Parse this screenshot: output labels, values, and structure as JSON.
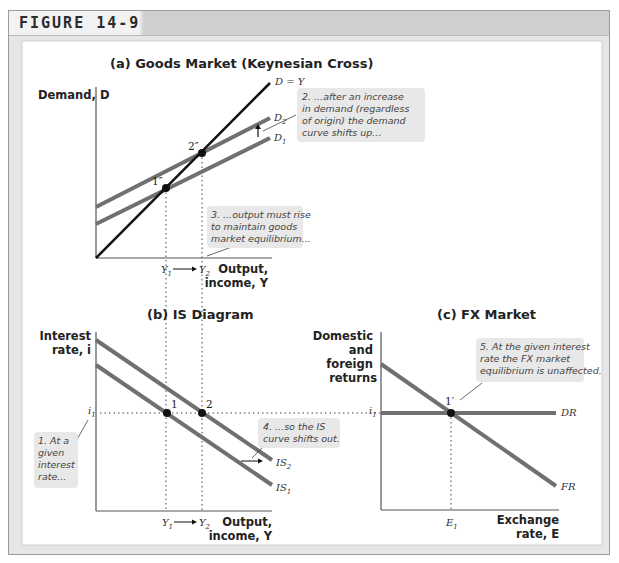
{
  "figure": {
    "label": "FIGURE 14-9"
  },
  "panels": {
    "a": {
      "title": "(a) Goods Market (Keynesian Cross)",
      "y_axis_label": "Demand, D",
      "x_axis_label_line1": "Output,",
      "x_axis_label_line2": "income, Y",
      "curves": {
        "dy": "D = Y",
        "d2": "D",
        "d2_sub": "2",
        "d1": "D",
        "d1_sub": "1"
      },
      "points": {
        "p1": "1″",
        "p2": "2″"
      },
      "ticks": {
        "y1": "Y",
        "y1_sub": "1",
        "y2": "Y",
        "y2_sub": "2"
      },
      "notes": {
        "n2": [
          "2. ...after an increase",
          "in demand (regardless",
          "of origin) the demand",
          "curve shifts up..."
        ],
        "n3": [
          "3. ...output must rise",
          "to maintain goods",
          "market equilibrium..."
        ]
      }
    },
    "b": {
      "title": "(b) IS Diagram",
      "y_axis_label_line1": "Interest",
      "y_axis_label_line2": "rate, i",
      "x_axis_label_line1": "Output,",
      "x_axis_label_line2": "income, Y",
      "curves": {
        "is2": "IS",
        "is2_sub": "2",
        "is1": "IS",
        "is1_sub": "1"
      },
      "points": {
        "p1": "1",
        "p2": "2"
      },
      "ticks": {
        "i1": "i",
        "i1_sub": "1",
        "y1": "Y",
        "y1_sub": "1",
        "y2": "Y",
        "y2_sub": "2"
      },
      "notes": {
        "n1": [
          "1. At a",
          "given",
          "interest",
          "rate..."
        ],
        "n4": [
          "4. ...so the IS",
          "curve shifts out."
        ]
      }
    },
    "c": {
      "title": "(c) FX Market",
      "y_axis_label_lines": [
        "Domestic",
        "and",
        "foreign",
        "returns"
      ],
      "x_axis_label_line1": "Exchange",
      "x_axis_label_line2": "rate, E",
      "curves": {
        "dr": "DR",
        "fr": "FR"
      },
      "points": {
        "p1": "1′"
      },
      "ticks": {
        "i1": "i",
        "i1_sub": "1",
        "e1": "E",
        "e1_sub": "1"
      },
      "notes": {
        "n5": [
          "5. At the given interest",
          "rate the FX market",
          "equilibrium is unaffected."
        ]
      }
    }
  },
  "colors": {
    "frame_bg": "#e6e6e6",
    "header_band": "#cfcfcf",
    "curve_gray": "#707070",
    "curve_black": "#111111",
    "note_bg": "#e8e8e8"
  }
}
